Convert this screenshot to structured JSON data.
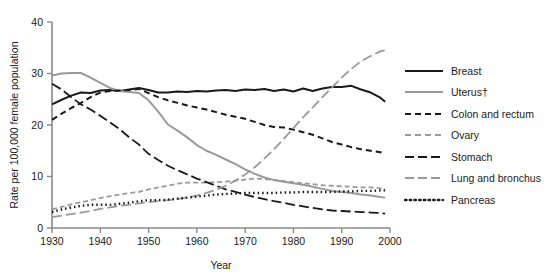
{
  "chart_data": {
    "type": "line",
    "title": "",
    "xlabel": "Year",
    "ylabel": "Rate per 100,000 female population",
    "xlim": [
      1930,
      2000
    ],
    "ylim": [
      0,
      40
    ],
    "xticks": [
      1930,
      1940,
      1950,
      1960,
      1970,
      1980,
      1990,
      2000
    ],
    "yticks": [
      0,
      10,
      20,
      30,
      40
    ],
    "grid": false,
    "legend_position": "right",
    "x": [
      1930,
      1932,
      1934,
      1936,
      1938,
      1940,
      1942,
      1944,
      1946,
      1948,
      1950,
      1952,
      1954,
      1956,
      1958,
      1960,
      1962,
      1964,
      1966,
      1968,
      1970,
      1972,
      1974,
      1976,
      1978,
      1980,
      1982,
      1984,
      1986,
      1988,
      1990,
      1992,
      1994,
      1996,
      1998,
      1999
    ],
    "series": [
      {
        "name": "Breast",
        "color": "#1a1a1a",
        "dash": "none",
        "width": 2.0,
        "values": [
          24.0,
          24.9,
          25.7,
          26.3,
          26.2,
          26.7,
          26.8,
          26.6,
          26.9,
          27.2,
          26.8,
          26.3,
          26.3,
          26.5,
          26.4,
          26.6,
          26.5,
          26.7,
          26.8,
          26.6,
          26.9,
          26.8,
          27.0,
          26.6,
          26.9,
          26.5,
          27.1,
          26.6,
          27.1,
          27.4,
          27.4,
          27.6,
          26.9,
          26.3,
          25.3,
          24.5
        ]
      },
      {
        "name": "Uterus†",
        "color": "#9a9a9a",
        "dash": "none",
        "width": 2.0,
        "values": [
          29.6,
          30.0,
          30.1,
          30.1,
          29.2,
          28.2,
          27.2,
          26.6,
          26.4,
          26.2,
          24.8,
          22.6,
          20.1,
          18.9,
          17.6,
          16.1,
          15.0,
          14.2,
          13.3,
          12.4,
          11.4,
          10.5,
          9.8,
          9.3,
          9.0,
          8.7,
          8.4,
          8.0,
          7.6,
          7.2,
          7.0,
          6.8,
          6.5,
          6.3,
          6.0,
          5.9
        ]
      },
      {
        "name": "Colon and rectum",
        "color": "#1a1a1a",
        "dash": "6,4",
        "width": 2.0,
        "values": [
          21.0,
          22.2,
          23.3,
          24.3,
          25.4,
          26.3,
          26.6,
          26.7,
          26.8,
          27.0,
          26.2,
          25.4,
          24.8,
          24.3,
          23.8,
          23.4,
          23.0,
          22.5,
          22.0,
          21.6,
          21.2,
          20.6,
          20.0,
          19.6,
          19.5,
          19.1,
          18.6,
          18.1,
          17.4,
          16.7,
          16.2,
          15.7,
          15.3,
          15.0,
          14.7,
          14.5
        ]
      },
      {
        "name": "Ovary",
        "color": "#9a9a9a",
        "dash": "5,3",
        "width": 1.8,
        "values": [
          3.6,
          4.1,
          4.6,
          5.0,
          5.4,
          5.8,
          6.2,
          6.5,
          6.8,
          7.0,
          7.5,
          7.9,
          8.2,
          8.6,
          8.8,
          8.8,
          8.8,
          8.9,
          9.0,
          9.2,
          9.4,
          9.6,
          9.5,
          9.3,
          9.1,
          8.9,
          8.7,
          8.5,
          8.3,
          8.2,
          8.1,
          8.0,
          7.9,
          7.9,
          7.7,
          7.6
        ]
      },
      {
        "name": "Stomach",
        "color": "#1a1a1a",
        "dash": "10,4",
        "width": 1.8,
        "values": [
          28.0,
          26.9,
          25.4,
          24.0,
          23.0,
          21.8,
          20.5,
          19.2,
          17.6,
          16.2,
          14.4,
          13.2,
          12.1,
          11.2,
          10.4,
          9.6,
          8.9,
          8.2,
          7.5,
          7.0,
          6.5,
          6.0,
          5.6,
          5.2,
          4.9,
          4.5,
          4.2,
          3.9,
          3.6,
          3.4,
          3.3,
          3.2,
          3.1,
          3.0,
          2.9,
          2.8
        ]
      },
      {
        "name": "Lung and bronchus",
        "color": "#9a9a9a",
        "dash": "10,4",
        "width": 1.8,
        "values": [
          2.1,
          2.4,
          2.7,
          3.0,
          3.3,
          3.7,
          4.0,
          4.3,
          4.5,
          4.8,
          5.0,
          5.2,
          5.4,
          5.6,
          5.9,
          6.3,
          6.8,
          7.4,
          8.2,
          9.2,
          10.4,
          11.8,
          13.5,
          15.3,
          17.3,
          19.4,
          21.5,
          23.4,
          25.4,
          27.3,
          29.2,
          30.9,
          32.4,
          33.4,
          34.3,
          34.5
        ]
      },
      {
        "name": "Pancreas",
        "color": "#1a1a1a",
        "dash": "1.5,3",
        "width": 2.4,
        "values": [
          3.1,
          3.6,
          4.0,
          4.3,
          4.5,
          4.5,
          4.5,
          4.7,
          4.9,
          5.2,
          5.4,
          5.4,
          5.5,
          5.7,
          5.9,
          6.1,
          6.3,
          6.5,
          6.6,
          6.7,
          6.8,
          6.8,
          6.8,
          6.8,
          6.9,
          6.9,
          7.0,
          7.0,
          7.0,
          7.0,
          7.1,
          7.1,
          7.2,
          7.2,
          7.3,
          7.3
        ]
      }
    ]
  },
  "axes": {
    "x_label": "Year",
    "y_label": "Rate per 100,000 female population",
    "x_ticks": [
      "1930",
      "1940",
      "1950",
      "1960",
      "1970",
      "1980",
      "1990",
      "2000"
    ],
    "y_ticks": [
      "0",
      "10",
      "20",
      "30",
      "40"
    ]
  },
  "legend": {
    "items": [
      {
        "label": "Breast",
        "color": "#1a1a1a",
        "style": "solid"
      },
      {
        "label": "Uterus†",
        "color": "#9a9a9a",
        "style": "solid"
      },
      {
        "label": "Colon and rectum",
        "color": "#1a1a1a",
        "style": "dashed"
      },
      {
        "label": "Ovary",
        "color": "#9a9a9a",
        "style": "dashed"
      },
      {
        "label": "Stomach",
        "color": "#1a1a1a",
        "style": "long-dash"
      },
      {
        "label": "Lung and bronchus",
        "color": "#9a9a9a",
        "style": "long-dash"
      },
      {
        "label": "Pancreas",
        "color": "#1a1a1a",
        "style": "dotted"
      }
    ]
  },
  "colors": {
    "dark": "#1a1a1a",
    "gray": "#9a9a9a",
    "axis": "#8a8a8a",
    "background": "#ffffff"
  }
}
